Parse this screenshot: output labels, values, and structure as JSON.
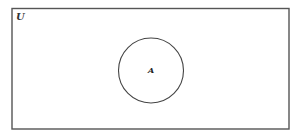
{
  "diagram": {
    "type": "venn",
    "universal_set": {
      "label": "U",
      "shape": "rectangle",
      "x": 12,
      "y": 8.5,
      "width": 277,
      "height": 120.5,
      "stroke": "#555555"
    },
    "sets": [
      {
        "label": "A",
        "shape": "circle",
        "cx": 151,
        "cy": 70.5,
        "r": 32.5,
        "stroke": "#444444"
      }
    ]
  }
}
